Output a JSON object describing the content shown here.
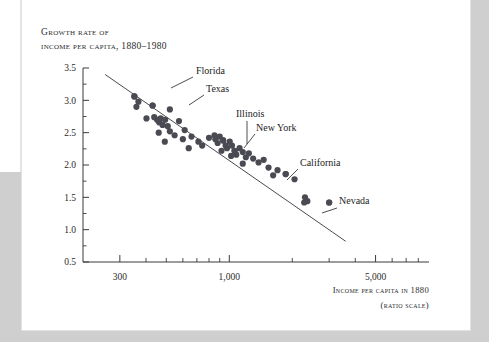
{
  "page": {
    "background_color": "#cfcfcf",
    "sheet_color": "#ffffff"
  },
  "chart_data": {
    "type": "scatter",
    "title_line1": "Growth rate of",
    "title_line2": "income per capita, 1880–1980",
    "xlabel_line1": "Income per capita in 1880",
    "xlabel_line2": "(ratio scale)",
    "ylabel": "",
    "x_scale": "log",
    "xlim": [
      200,
      9000
    ],
    "ylim": [
      0.5,
      3.5
    ],
    "grid": false,
    "legend": "none",
    "x_ticks_major": [
      300,
      1000,
      5000
    ],
    "x_tick_labels": [
      "300",
      "1,000",
      "5,000"
    ],
    "x_ticks_minor": [
      400,
      500,
      600,
      700,
      800,
      900,
      2000,
      3000,
      4000,
      6000,
      7000,
      8000
    ],
    "y_ticks_major": [
      0.5,
      1.0,
      1.5,
      2.0,
      2.5,
      3.0,
      3.5
    ],
    "y_tick_labels": [
      "0.5",
      "1.0",
      "1.5",
      "2.0",
      "2.5",
      "3.0",
      "3.5"
    ],
    "y_ticks_minor": [
      0.75,
      1.25,
      1.75,
      2.25,
      2.75,
      3.25
    ],
    "point_color": "#4a4a52",
    "fit_line_color": "#4a4a52",
    "fit_line": {
      "x1": 255,
      "y1": 3.4,
      "x2": 3600,
      "y2": 0.82
    },
    "points": [
      {
        "x": 352,
        "y": 3.06
      },
      {
        "x": 368,
        "y": 2.98
      },
      {
        "x": 360,
        "y": 2.9
      },
      {
        "x": 430,
        "y": 2.92
      },
      {
        "x": 402,
        "y": 2.72
      },
      {
        "x": 438,
        "y": 2.74
      },
      {
        "x": 452,
        "y": 2.7
      },
      {
        "x": 462,
        "y": 2.66
      },
      {
        "x": 470,
        "y": 2.72
      },
      {
        "x": 480,
        "y": 2.62
      },
      {
        "x": 494,
        "y": 2.7
      },
      {
        "x": 508,
        "y": 2.6
      },
      {
        "x": 460,
        "y": 2.5
      },
      {
        "x": 520,
        "y": 2.52
      },
      {
        "x": 548,
        "y": 2.46
      },
      {
        "x": 492,
        "y": 2.36
      },
      {
        "x": 612,
        "y": 2.54
      },
      {
        "x": 600,
        "y": 2.4
      },
      {
        "x": 660,
        "y": 2.44
      },
      {
        "x": 712,
        "y": 2.36
      },
      {
        "x": 640,
        "y": 2.26
      },
      {
        "x": 742,
        "y": 2.3
      },
      {
        "x": 800,
        "y": 2.42
      },
      {
        "x": 850,
        "y": 2.46
      },
      {
        "x": 858,
        "y": 2.4
      },
      {
        "x": 880,
        "y": 2.34
      },
      {
        "x": 900,
        "y": 2.44
      },
      {
        "x": 935,
        "y": 2.38
      },
      {
        "x": 960,
        "y": 2.3
      },
      {
        "x": 918,
        "y": 2.22
      },
      {
        "x": 975,
        "y": 2.26
      },
      {
        "x": 1005,
        "y": 2.36
      },
      {
        "x": 1030,
        "y": 2.3
      },
      {
        "x": 1060,
        "y": 2.22
      },
      {
        "x": 1020,
        "y": 2.14
      },
      {
        "x": 1080,
        "y": 2.16
      },
      {
        "x": 1120,
        "y": 2.26
      },
      {
        "x": 1160,
        "y": 2.2
      },
      {
        "x": 1200,
        "y": 2.12
      },
      {
        "x": 1240,
        "y": 2.18
      },
      {
        "x": 1300,
        "y": 2.1
      },
      {
        "x": 1160,
        "y": 2.02
      },
      {
        "x": 1380,
        "y": 2.04
      },
      {
        "x": 1460,
        "y": 2.08
      },
      {
        "x": 1540,
        "y": 1.96
      },
      {
        "x": 1700,
        "y": 1.92
      },
      {
        "x": 1620,
        "y": 1.84
      },
      {
        "x": 1860,
        "y": 1.86
      },
      {
        "x": 2050,
        "y": 1.78
      },
      {
        "x": 2300,
        "y": 1.5
      },
      {
        "x": 2360,
        "y": 1.44
      },
      {
        "x": 2280,
        "y": 1.42
      },
      {
        "x": 3000,
        "y": 1.42
      },
      {
        "x": 520,
        "y": 2.86
      },
      {
        "x": 575,
        "y": 2.68
      }
    ],
    "annotations": [
      {
        "label": "Florida",
        "point": {
          "x": 352,
          "y": 3.06
        },
        "text_pos": {
          "x": 196,
          "y": 74
        },
        "leader": [
          [
            193,
            77
          ],
          [
            171,
            88
          ]
        ]
      },
      {
        "label": "Texas",
        "point": {
          "x": 430,
          "y": 2.92
        },
        "text_pos": {
          "x": 206,
          "y": 92
        },
        "leader": [
          [
            204,
            95
          ],
          [
            189,
            105
          ]
        ]
      },
      {
        "label": "Illinois",
        "point": {
          "x": 935,
          "y": 2.38
        },
        "text_pos": {
          "x": 236,
          "y": 117
        },
        "leader": [
          [
            247,
            121
          ],
          [
            247,
            144
          ]
        ]
      },
      {
        "label": "New York",
        "point": {
          "x": 1060,
          "y": 2.22
        },
        "text_pos": {
          "x": 256,
          "y": 131
        },
        "leader": [
          [
            255,
            134
          ],
          [
            244,
            148
          ]
        ]
      },
      {
        "label": "California",
        "point": {
          "x": 1860,
          "y": 1.86
        },
        "text_pos": {
          "x": 300,
          "y": 166
        },
        "leader": [
          [
            298,
            169
          ],
          [
            287,
            180
          ]
        ]
      },
      {
        "label": "Nevada",
        "point": {
          "x": 3000,
          "y": 1.42
        },
        "text_pos": {
          "x": 339,
          "y": 204
        },
        "leader": [
          [
            337,
            208
          ],
          [
            322,
            213
          ]
        ]
      }
    ]
  }
}
